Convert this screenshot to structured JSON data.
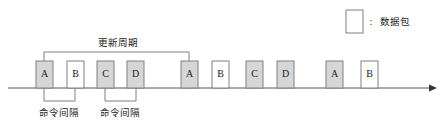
{
  "diagram": {
    "title_text": "更新周期",
    "axis": {
      "name": "time-axis",
      "x_start": 8,
      "x_end": 437,
      "y": 88,
      "arrow": "arrow-right-icon"
    },
    "colors": {
      "packet_shaded_fill": "#d6d6d6",
      "packet_plain_fill": "#ffffff",
      "stroke": "#808080",
      "text": "#1a1a1a",
      "axis": "#555555"
    },
    "packet_box": {
      "width": 17,
      "height": 27,
      "top": 61
    },
    "packets": [
      {
        "label": "A",
        "x": 36,
        "shaded": true
      },
      {
        "label": "B",
        "x": 67,
        "shaded": false
      },
      {
        "label": "C",
        "x": 97,
        "shaded": true
      },
      {
        "label": "D",
        "x": 127,
        "shaded": true
      },
      {
        "label": "A",
        "x": 181,
        "shaded": true
      },
      {
        "label": "B",
        "x": 212,
        "shaded": false
      },
      {
        "label": "C",
        "x": 246,
        "shaded": true
      },
      {
        "label": "D",
        "x": 277,
        "shaded": true
      },
      {
        "label": "A",
        "x": 326,
        "shaded": true
      },
      {
        "label": "B",
        "x": 361,
        "shaded": false
      }
    ],
    "update_cycle_bracket": {
      "label": "更新周期",
      "label_x": 118,
      "label_y": 43,
      "left_x": 44,
      "right_x": 189,
      "top_y": 52,
      "bottom_y": 61
    },
    "command_intervals": [
      {
        "label": "命令间隔",
        "label_x": 59,
        "label_y": 113,
        "left_x": 44,
        "right_x": 75,
        "top_y": 88,
        "bottom_y": 101
      },
      {
        "label": "命令间隔",
        "label_x": 120,
        "label_y": 113,
        "left_x": 105,
        "right_x": 136,
        "top_y": 88,
        "bottom_y": 101
      }
    ],
    "legend": {
      "swatch_name": "packet-swatch",
      "swatch_x": 346,
      "swatch_y": 10,
      "swatch_width": 17,
      "swatch_height": 23,
      "colon": ":",
      "colon_x": 371,
      "colon_y": 22,
      "text": "数据包",
      "text_x": 380,
      "text_y": 22
    }
  }
}
